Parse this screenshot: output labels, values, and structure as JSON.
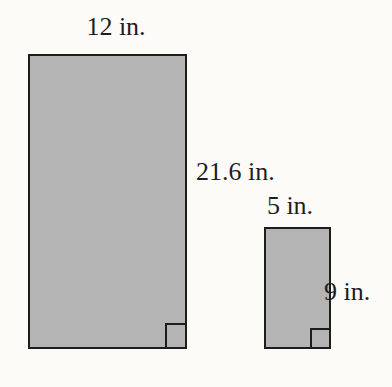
{
  "colors": {
    "page-bg": "#fcfbf8",
    "rect-fill": "#b4b4b4",
    "stroke": "#1c1c1c",
    "text": "#1d1d1d"
  },
  "diagram": {
    "unit": "in.",
    "rectangles": [
      {
        "id": "large",
        "width_label": "12 in.",
        "height_label": "21.6 in.",
        "width_value": 12,
        "height_value": 21.6
      },
      {
        "id": "small",
        "width_label": "5 in.",
        "height_label": "9 in.",
        "width_value": 5,
        "height_value": 9
      }
    ]
  }
}
